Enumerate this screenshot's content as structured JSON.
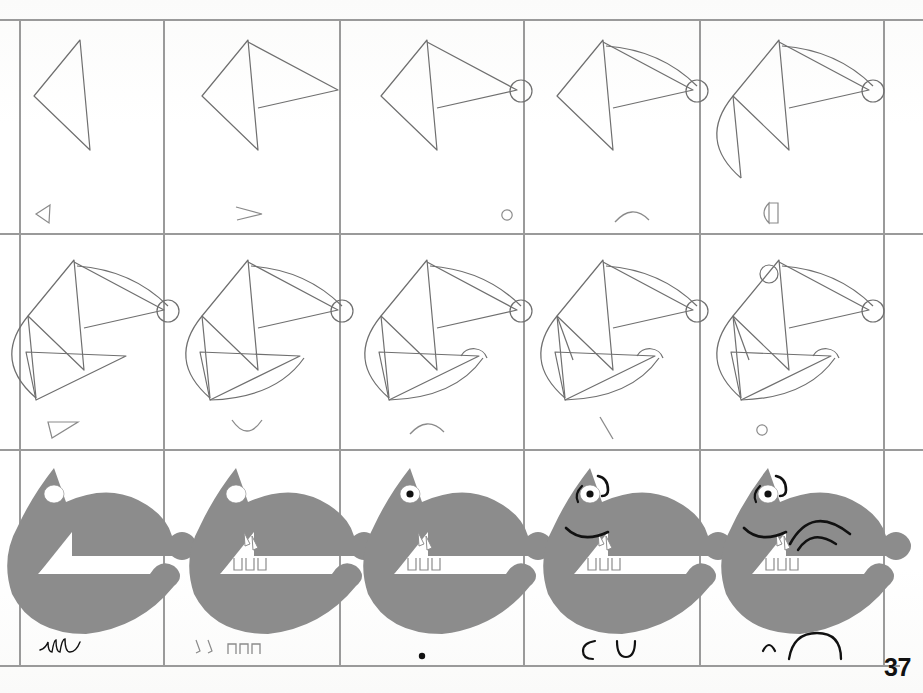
{
  "page": {
    "number": "37",
    "kind": "drawing-tutorial-grid",
    "background_color": "#ffffff",
    "ink_color": "#6f6f6f",
    "dark_ink_color": "#111111",
    "fill_color": "#8c8c8c",
    "grid": {
      "columns": 5,
      "rows": 3,
      "left": 20,
      "top": 20,
      "right": 884,
      "bottom": 666,
      "x_lines": [
        20,
        164,
        340,
        524,
        700,
        884
      ],
      "y_lines": [
        20,
        234,
        450,
        666
      ],
      "line_color": "#9a9a9a",
      "line_width": 1.1
    }
  },
  "cells": [
    {
      "index": 1,
      "row": 1,
      "col": 1,
      "step_label": "step-1",
      "description": "Open arrow-head triangle outline",
      "hint_glyph": "small-triangle-left",
      "style": "outline"
    },
    {
      "index": 2,
      "row": 1,
      "col": 2,
      "step_label": "step-2",
      "description": "Triangle with long tapering wedge to the right",
      "hint_glyph": "small-wedge-right",
      "style": "outline"
    },
    {
      "index": 3,
      "row": 1,
      "col": 3,
      "step_label": "step-3",
      "description": "Wedge terminates in a small circle (nose)",
      "hint_glyph": "small-circle",
      "style": "outline"
    },
    {
      "index": 4,
      "row": 1,
      "col": 4,
      "step_label": "step-4",
      "description": "Arc added along the top of the muzzle",
      "hint_glyph": "small-arc-up",
      "style": "outline"
    },
    {
      "index": 5,
      "row": 1,
      "col": 5,
      "step_label": "step-5",
      "description": "Crescent cheek shape added at the left",
      "hint_glyph": "small-half-disc",
      "style": "outline"
    },
    {
      "index": 6,
      "row": 2,
      "col": 1,
      "step_label": "step-6",
      "description": "Lower jaw drawn as a long triangle",
      "hint_glyph": "small-flat-triangle",
      "style": "outline"
    },
    {
      "index": 7,
      "row": 2,
      "col": 2,
      "step_label": "step-7",
      "description": "Curved underside of the jaw added",
      "hint_glyph": "small-arc-down",
      "style": "outline"
    },
    {
      "index": 8,
      "row": 2,
      "col": 3,
      "step_label": "step-8",
      "description": "Rounded chin bump added to the jaw",
      "hint_glyph": "small-arc-up",
      "style": "outline"
    },
    {
      "index": 9,
      "row": 2,
      "col": 4,
      "step_label": "step-9",
      "description": "Short stroke drawn inside the cheek",
      "hint_glyph": "small-slash",
      "style": "outline"
    },
    {
      "index": 10,
      "row": 2,
      "col": 5,
      "step_label": "step-10",
      "description": "Small circle added for the eye",
      "hint_glyph": "small-circle",
      "style": "outline"
    },
    {
      "index": 11,
      "row": 3,
      "col": 1,
      "step_label": "step-11",
      "description": "Shape filled solid grey, white eye highlight",
      "hint_glyph": "scribble-flourish",
      "style": "filled"
    },
    {
      "index": 12,
      "row": 3,
      "col": 2,
      "step_label": "step-12",
      "description": "Teeth added in the mouth",
      "hint_glyph": "two-fangs-and-three-teeth",
      "style": "filled"
    },
    {
      "index": 13,
      "row": 3,
      "col": 3,
      "step_label": "step-13",
      "description": "Black pupil added to the eye",
      "hint_glyph": "small-dot",
      "style": "filled"
    },
    {
      "index": 14,
      "row": 3,
      "col": 4,
      "step_label": "step-14",
      "description": "Brow and snout wrinkle lines added",
      "hint_glyph": "two-hooks",
      "style": "filled"
    },
    {
      "index": 15,
      "row": 3,
      "col": 5,
      "step_label": "step-15",
      "description": "Ear arcs added behind the head, drawing complete",
      "hint_glyph": "small-hook-and-big-arc",
      "style": "filled"
    }
  ]
}
